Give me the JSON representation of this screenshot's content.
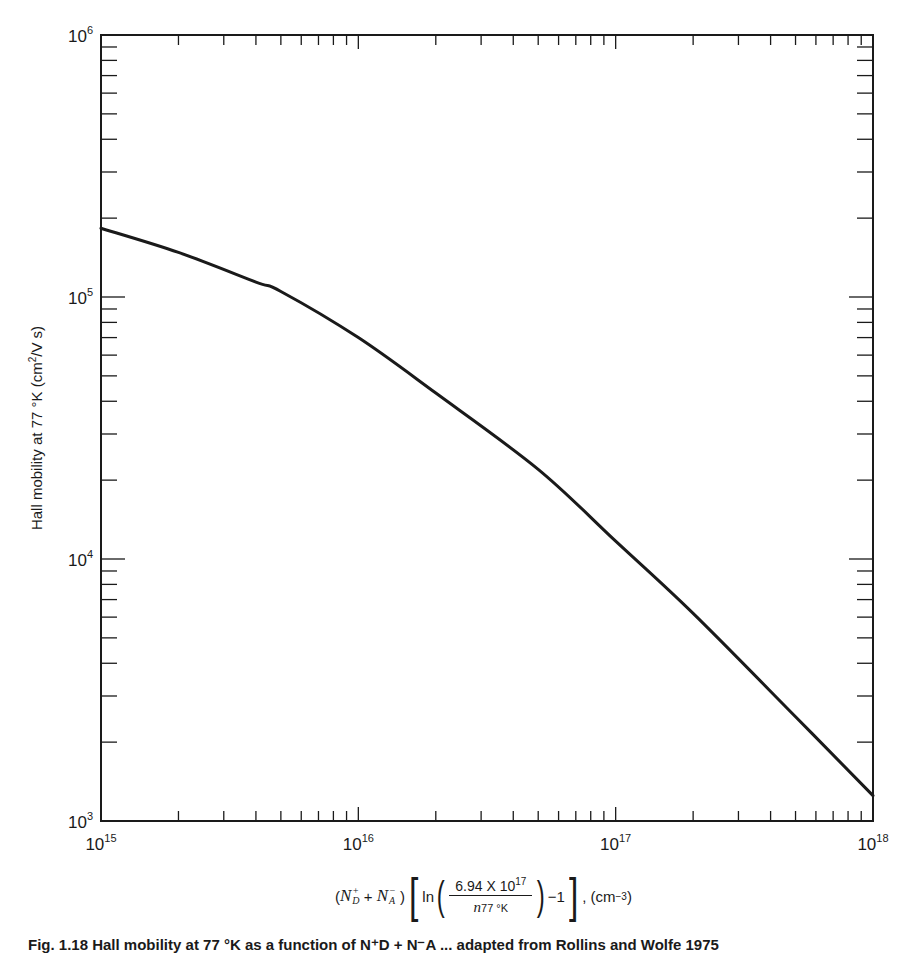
{
  "chart_data": {
    "type": "line",
    "title": "",
    "xlabel": "(N_D^+ + N_A^-) [ln(6.94 X 10^17 / n_77°K) - 1], (cm^-3)",
    "ylabel": "Hall mobility at 77 °K (cm^2/V s)",
    "xscale": "log",
    "yscale": "log",
    "xlim": [
      1000000000000000.0,
      1e+18
    ],
    "ylim": [
      1000.0,
      1000000.0
    ],
    "x_tick_labels": [
      "10^15",
      "10^16",
      "10^17",
      "10^18"
    ],
    "y_tick_labels": [
      "10^3",
      "10^4",
      "10^5",
      "10^6"
    ],
    "grid": false,
    "legend": null,
    "series": [
      {
        "name": "Hall mobility",
        "x": [
          1000000000000000.0,
          2000000000000000.0,
          4000000000000000.0,
          5000000000000000.0,
          1e+16,
          2e+16,
          5e+16,
          1e+17,
          2e+17,
          5e+17,
          1e+18
        ],
        "values": [
          183000,
          148000,
          114000,
          105000,
          70000,
          43000,
          22000,
          11700,
          6200,
          2500,
          1250
        ]
      }
    ]
  },
  "axes": {
    "y_label": "Hall mobility at 77 °K (cm",
    "y_label_sup": "2",
    "y_label_tail": "/V s)",
    "y_ticks": [
      {
        "base": "10",
        "exp": "6"
      },
      {
        "base": "10",
        "exp": "5"
      },
      {
        "base": "10",
        "exp": "4"
      },
      {
        "base": "10",
        "exp": "3"
      }
    ],
    "x_ticks": [
      {
        "base": "10",
        "exp": "15"
      },
      {
        "base": "10",
        "exp": "16"
      },
      {
        "base": "10",
        "exp": "17"
      },
      {
        "base": "10",
        "exp": "18"
      }
    ]
  },
  "xlabel_parts": {
    "open": "(",
    "nd": "N",
    "nd_sup": "+",
    "nd_sub": "D",
    "plus": " + ",
    "na": "N",
    "na_sup": "−",
    "na_sub": "A",
    "close": " )",
    "ln": "ln",
    "numerator": "6.94 X 10",
    "numerator_exp": "17",
    "denominator_n": "n",
    "denominator_sub": "77 °K",
    "minus_one": "−1",
    "units": ", (cm",
    "units_exp": "−3",
    "units_close": ")"
  },
  "caption": "Fig. 1.18 Hall mobility at 77 °K as a function of N⁺D + N⁻A ... adapted from Rollins and Wolfe 1975"
}
